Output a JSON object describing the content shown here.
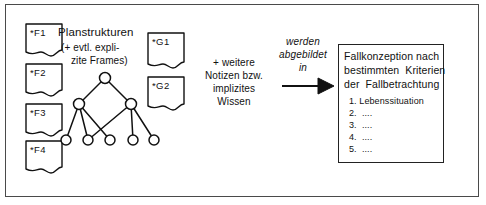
{
  "figure": {
    "width": 486,
    "height": 205,
    "background": "#ffffff",
    "line_color": "#111111",
    "frame_color": "#4a4a4a"
  },
  "plan_notes": [
    {
      "id": "F1",
      "label": "*F1",
      "x": 26,
      "y": 24
    },
    {
      "id": "F2",
      "label": "*F2",
      "x": 26,
      "y": 64
    },
    {
      "id": "F3",
      "label": "*F3",
      "x": 26,
      "y": 104
    },
    {
      "id": "F4",
      "label": "*F4",
      "x": 26,
      "y": 141
    }
  ],
  "goal_notes": [
    {
      "id": "G1",
      "label": "*G1",
      "x": 148,
      "y": 33
    },
    {
      "id": "G2",
      "label": "*G2",
      "x": 148,
      "y": 77
    }
  ],
  "plan_caption": {
    "title": "Planstrukturen",
    "sub_line1": "(+ evtl. expli-",
    "sub_line2": "zite Frames)"
  },
  "middle_caption": {
    "line1": "+ weitere",
    "line2": "Notizen bzw.",
    "line3": "implizites",
    "line4": "Wissen"
  },
  "arrow_caption": {
    "line1": "werden",
    "line2": "abgebildet",
    "line3": "in"
  },
  "result_box": {
    "heading_line1": "Fallkonzeption nach",
    "heading_line2": "bestimmten  Kriterien",
    "heading_line3": "der  Fallbetrachtung",
    "items": [
      "1. Lebenssituation",
      "2.  ....",
      "3.  ....",
      "4.  ....",
      "5.  ...."
    ]
  },
  "graph": {
    "description": "plan-structure-network",
    "nodes": [
      {
        "id": "root",
        "x": 105,
        "y": 78,
        "r": 5.5
      },
      {
        "id": "midL",
        "x": 79,
        "y": 104,
        "r": 5.5
      },
      {
        "id": "midR",
        "x": 131,
        "y": 104,
        "r": 5.5
      },
      {
        "id": "leaf1",
        "x": 66,
        "y": 140,
        "r": 5
      },
      {
        "id": "leaf2",
        "x": 88,
        "y": 140,
        "r": 5
      },
      {
        "id": "leaf3",
        "x": 110,
        "y": 140,
        "r": 5
      },
      {
        "id": "leaf4",
        "x": 133,
        "y": 140,
        "r": 5
      },
      {
        "id": "leaf5",
        "x": 154,
        "y": 140,
        "r": 5
      }
    ],
    "edges": [
      [
        "root",
        "midL"
      ],
      [
        "root",
        "midR"
      ],
      [
        "midL",
        "leaf1"
      ],
      [
        "midL",
        "leaf2"
      ],
      [
        "midL",
        "leaf3"
      ],
      [
        "midR",
        "leaf2"
      ],
      [
        "midR",
        "leaf4"
      ],
      [
        "midR",
        "leaf5"
      ]
    ]
  },
  "arrow": {
    "x1": 282,
    "y1": 86,
    "x2": 334,
    "y2": 86
  }
}
